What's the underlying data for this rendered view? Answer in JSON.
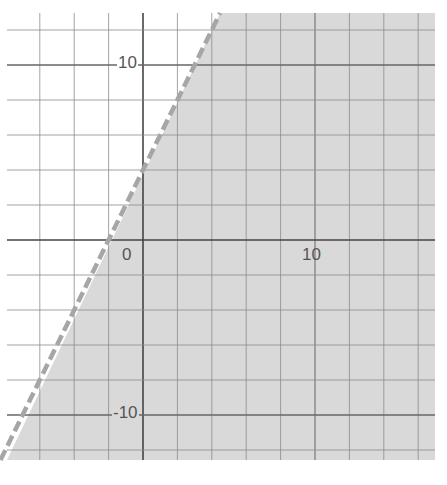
{
  "chart_data": {
    "type": "inequality-graph",
    "title": "",
    "xlabel": "",
    "ylabel": "",
    "inequality": "y < 2x + 4",
    "boundary_line": {
      "slope": 2,
      "intercept": 4,
      "style": "dashed",
      "color": "#a6a6a6"
    },
    "shaded_region": "below/right of line",
    "shade_color": "#d9d9d9",
    "xlim": [
      -7.9,
      17
    ],
    "ylim": [
      -12.6,
      13
    ],
    "grid": true,
    "grid_step": 2,
    "tick_labels": {
      "x": [
        {
          "value": 0,
          "label": "0"
        },
        {
          "value": 10,
          "label": "10"
        }
      ],
      "y": [
        {
          "value": 10,
          "label": "10"
        },
        {
          "value": -10,
          "label": "-10"
        }
      ]
    },
    "key_points": [
      {
        "x": -2,
        "y": 0
      },
      {
        "x": 0,
        "y": 4
      }
    ]
  },
  "labels": {
    "x0": "0",
    "x10": "10",
    "y10": "10",
    "yneg10": "-10"
  }
}
